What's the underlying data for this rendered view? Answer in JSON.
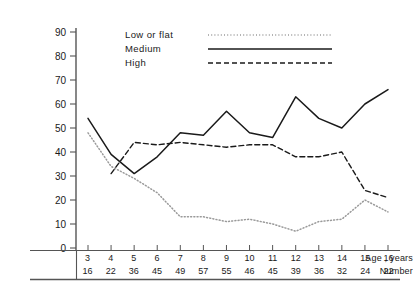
{
  "chart_data": {
    "type": "line",
    "title": "",
    "xlabel": "Age, years",
    "ylabel": "",
    "xlim": [
      3,
      16
    ],
    "ylim": [
      0,
      90
    ],
    "yticks": [
      0,
      10,
      20,
      30,
      40,
      50,
      60,
      70,
      80,
      90
    ],
    "grid": false,
    "legend_position": "top-center",
    "categories": [
      3,
      4,
      5,
      6,
      7,
      8,
      9,
      10,
      11,
      12,
      13,
      14,
      15,
      16
    ],
    "series": [
      {
        "name": "Low or flat",
        "style": "dotted",
        "color": "#9a9a9a",
        "values": [
          48,
          34,
          29,
          23,
          13,
          13,
          11,
          12,
          10,
          7,
          11,
          12,
          20,
          15
        ]
      },
      {
        "name": "Medium",
        "style": "solid",
        "color": "#1a1a1a",
        "values": [
          54,
          39,
          31,
          38,
          48,
          47,
          57,
          48,
          46,
          63,
          54,
          50,
          60,
          66
        ]
      },
      {
        "name": "High",
        "style": "dashed",
        "color": "#1a1a1a",
        "values": [
          null,
          31,
          44,
          43,
          44,
          43,
          42,
          43,
          43,
          38,
          38,
          40,
          24,
          21
        ]
      }
    ]
  },
  "table": {
    "age_row_label": "Age , years",
    "number_row_label": "Number",
    "ages": [
      "3",
      "4",
      "5",
      "6",
      "7",
      "8",
      "9",
      "10",
      "11",
      "12",
      "13",
      "14",
      "15",
      "16"
    ],
    "numbers": [
      "16",
      "22",
      "36",
      "45",
      "49",
      "57",
      "55",
      "46",
      "45",
      "39",
      "36",
      "32",
      "24",
      "22"
    ]
  },
  "legend": {
    "items": [
      {
        "label": "Low or flat"
      },
      {
        "label": "Medium"
      },
      {
        "label": "High"
      }
    ]
  },
  "axis": {
    "ytick_labels": [
      "90",
      "80",
      "70",
      "60",
      "50",
      "40",
      "30",
      "20",
      "10",
      "0"
    ]
  }
}
